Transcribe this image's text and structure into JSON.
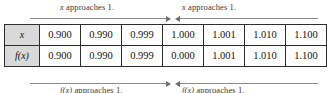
{
  "figure": {
    "kind": "limit-table",
    "approach_labels": {
      "top_left": "x approaches 1.",
      "top_right": "x approaches 1.",
      "bottom_left": "f(x) approaches 1.",
      "bottom_right": "f(x) approaches 1."
    },
    "label_parts": {
      "variable_x": "x",
      "approaches_text": " approaches 1.",
      "variable_fx": "f(x)"
    }
  },
  "colors": {
    "header_fill": "#d9d9d9",
    "table_border": "#2e2e2e",
    "rail_line": "#8b8b8b",
    "arrow_head": "#6f6f6f",
    "text": "#141414",
    "background": "#ffffff"
  },
  "chart_data": {
    "type": "table",
    "title": "",
    "xlabel": "x",
    "ylabel": "f(x)",
    "row_headers": [
      "x",
      "f(x)"
    ],
    "categories": [
      "0.900",
      "0.990",
      "0.999",
      "1.000",
      "1.001",
      "1.010",
      "1.100"
    ],
    "series": [
      {
        "name": "x",
        "values": [
          "0.900",
          "0.990",
          "0.999",
          "1.000",
          "1.001",
          "1.010",
          "1.100"
        ]
      },
      {
        "name": "f(x)",
        "values": [
          "0.900",
          "0.990",
          "0.999",
          "0.000",
          "1.001",
          "1.010",
          "1.100"
        ]
      }
    ],
    "annotations": [
      "x approaches 1.",
      "x approaches 1.",
      "f(x) approaches 1.",
      "f(x) approaches 1."
    ],
    "grid": true,
    "legend": "none"
  },
  "table": {
    "rows": [
      {
        "header": "x",
        "cells": [
          "0.900",
          "0.990",
          "0.999",
          "1.000",
          "1.001",
          "1.010",
          "1.100"
        ]
      },
      {
        "header": "f(x)",
        "cells": [
          "0.900",
          "0.990",
          "0.999",
          "0.000",
          "1.001",
          "1.010",
          "1.100"
        ]
      }
    ]
  }
}
